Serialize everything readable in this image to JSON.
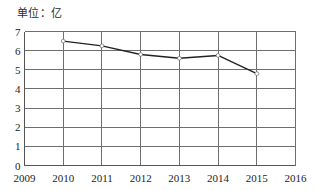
{
  "chart_data": {
    "type": "line",
    "title": "单位：亿",
    "xlabel": "",
    "ylabel": "",
    "x": [
      2009,
      2010,
      2011,
      2012,
      2013,
      2014,
      2015,
      2016
    ],
    "categories": [
      "2009",
      "2010",
      "2011",
      "2012",
      "2013",
      "2014",
      "2015",
      "2016"
    ],
    "xtick_labels": [
      "2009",
      "2010",
      "2011",
      "2012",
      "2013",
      "2014",
      "2015",
      "2016"
    ],
    "ytick_labels": [
      "0",
      "1",
      "2",
      "3",
      "4",
      "5",
      "6",
      "7"
    ],
    "yticks": [
      0,
      1,
      2,
      3,
      4,
      5,
      6,
      7
    ],
    "xlim": [
      2009,
      2016
    ],
    "ylim": [
      0,
      7
    ],
    "grid": true,
    "legend": false,
    "legend_position": "none",
    "series": [
      {
        "name": "数值",
        "color": "#222222",
        "x": [
          2010,
          2011,
          2012,
          2013,
          2014,
          2015
        ],
        "values": [
          6.5,
          6.25,
          5.8,
          5.6,
          5.75,
          4.8
        ],
        "point_labels": [
          "6.5",
          "6.25",
          "5.8",
          "5.6",
          "5.75",
          "4.8"
        ]
      }
    ],
    "annotations": []
  },
  "chart": {
    "unit_label": "单位：亿"
  }
}
